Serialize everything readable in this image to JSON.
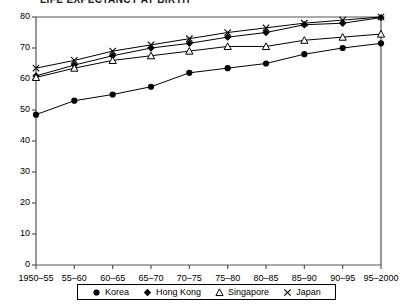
{
  "title_partial": "LIFE EXPECTANCY AT BIRTH",
  "chart_data": {
    "type": "line",
    "title": "LIFE EXPECTANCY AT BIRTH",
    "xlabel": "",
    "ylabel": "",
    "ylim": [
      0,
      80
    ],
    "yticks": [
      0,
      10,
      20,
      30,
      40,
      50,
      60,
      70,
      80
    ],
    "grid": false,
    "legend_position": "bottom",
    "categories": [
      "1950–55",
      "55–60",
      "60–65",
      "65–70",
      "70–75",
      "75–80",
      "80–85",
      "85–90",
      "90–95",
      "95–2000"
    ],
    "series": [
      {
        "name": "Korea",
        "marker": "filled-circle",
        "values": [
          48.5,
          53.0,
          55.0,
          57.5,
          62.0,
          63.5,
          65.0,
          68.0,
          70.0,
          71.5
        ]
      },
      {
        "name": "Hong Kong",
        "marker": "filled-diamond",
        "values": [
          61.0,
          64.5,
          67.5,
          70.0,
          71.5,
          73.5,
          75.0,
          77.5,
          78.0,
          79.8
        ]
      },
      {
        "name": "Singapore",
        "marker": "open-triangle",
        "values": [
          60.5,
          63.5,
          66.0,
          67.5,
          69.0,
          70.5,
          70.5,
          72.5,
          73.5,
          74.5
        ]
      },
      {
        "name": "Japan",
        "marker": "cross",
        "values": [
          63.5,
          66.0,
          69.0,
          71.0,
          73.0,
          75.0,
          76.5,
          78.0,
          79.0,
          80.0
        ]
      }
    ]
  },
  "legend": {
    "items": [
      {
        "label": "Korea",
        "marker": "filled-circle"
      },
      {
        "label": "Hong Kong",
        "marker": "filled-diamond"
      },
      {
        "label": "Singapore",
        "marker": "open-triangle"
      },
      {
        "label": "Japan",
        "marker": "cross"
      }
    ]
  },
  "colors": {
    "line": "#000000",
    "axis": "#555555",
    "text": "#000000",
    "background": "#ffffff"
  }
}
